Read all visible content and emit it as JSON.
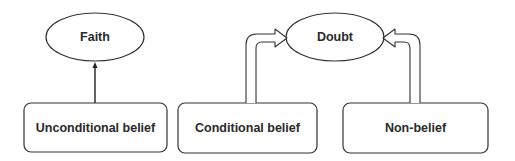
{
  "diagram": {
    "nodes": [
      {
        "id": "faith",
        "label": "Faith",
        "shape": "ellipse"
      },
      {
        "id": "doubt",
        "label": "Doubt",
        "shape": "ellipse"
      },
      {
        "id": "unconditional",
        "label": "Unconditional belief",
        "shape": "rounded-rect"
      },
      {
        "id": "conditional",
        "label": "Conditional belief",
        "shape": "rounded-rect"
      },
      {
        "id": "nonbelief",
        "label": "Non-belief",
        "shape": "rounded-rect"
      }
    ],
    "edges": [
      {
        "from": "unconditional",
        "to": "faith",
        "style": "thin-arrow"
      },
      {
        "from": "conditional",
        "to": "doubt",
        "style": "hollow-arrow"
      },
      {
        "from": "nonbelief",
        "to": "doubt",
        "style": "hollow-arrow"
      }
    ],
    "colors": {
      "stroke": "#333333",
      "text": "#2a2a2a",
      "background": "#ffffff"
    }
  }
}
